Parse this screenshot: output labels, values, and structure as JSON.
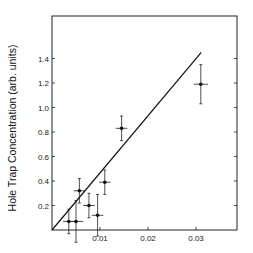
{
  "chart_data": {
    "type": "scatter",
    "title": "",
    "xlabel": "",
    "ylabel": "Hole Trap Concentration (arb. units)",
    "xlim": [
      0,
      0.038
    ],
    "ylim": [
      0,
      1.65
    ],
    "x_ticks": [
      "0.01",
      "0.02",
      "0.03"
    ],
    "y_ticks": [
      "0.2",
      "0.4",
      "0.6",
      "0.8",
      "1.0",
      "1.2",
      "1.4"
    ],
    "grid": false,
    "legend": null,
    "series": [
      {
        "name": "data",
        "points": [
          {
            "x": 0.0035,
            "y": 0.07,
            "xerr": 0.0012,
            "yerr": 0.1
          },
          {
            "x": 0.005,
            "y": 0.07,
            "xerr": 0.0015,
            "yerr": 0.17
          },
          {
            "x": 0.0057,
            "y": 0.32,
            "xerr": 0.0012,
            "yerr": 0.1
          },
          {
            "x": 0.0077,
            "y": 0.2,
            "xerr": 0.0012,
            "yerr": 0.1
          },
          {
            "x": 0.0095,
            "y": 0.12,
            "xerr": 0.0012,
            "yerr": 0.17
          },
          {
            "x": 0.011,
            "y": 0.39,
            "xerr": 0.0012,
            "yerr": 0.1
          },
          {
            "x": 0.0145,
            "y": 0.83,
            "xerr": 0.0012,
            "yerr": 0.1
          },
          {
            "x": 0.031,
            "y": 1.19,
            "xerr": 0.0015,
            "yerr": 0.16
          }
        ]
      },
      {
        "name": "fit",
        "type": "line",
        "x": [
          0,
          0.0311
        ],
        "y": [
          0,
          1.45
        ]
      }
    ]
  }
}
